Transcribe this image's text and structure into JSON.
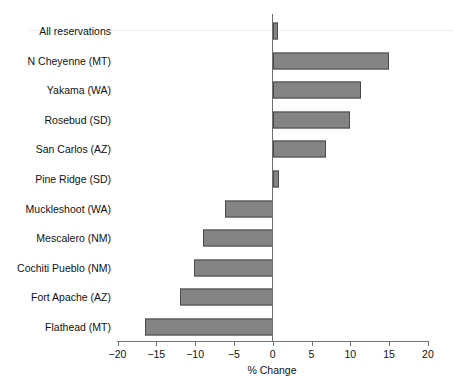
{
  "chart_data": {
    "type": "bar",
    "orientation": "horizontal",
    "title": "",
    "xlabel": "% Change",
    "ylabel": "",
    "xlim": [
      -20,
      20
    ],
    "xticks": [
      -20,
      -15,
      -10,
      -5,
      0,
      5,
      10,
      15,
      20
    ],
    "xtick_labels": [
      "−20",
      "−15",
      "−10",
      "−5",
      "0",
      "5",
      "10",
      "15",
      "20"
    ],
    "grid": false,
    "legend": null,
    "bar_fill_color": "#848484",
    "bar_border_color": "#4a4a4a",
    "axis_color": "#6f6f6f",
    "categories": [
      "All reservations",
      "N Cheyenne (MT)",
      "Yakama (WA)",
      "Rosebud (SD)",
      "San Carlos (AZ)",
      "Pine Ridge (SD)",
      "Muckleshoot (WA)",
      "Mescalero (NM)",
      "Cochiti Pueblo (NM)",
      "Fort Apache (AZ)",
      "Flathead (MT)"
    ],
    "values": [
      0.7,
      15.0,
      11.4,
      10.0,
      6.9,
      0.8,
      -6.1,
      -9.0,
      -10.1,
      -12.0,
      -16.4
    ]
  }
}
